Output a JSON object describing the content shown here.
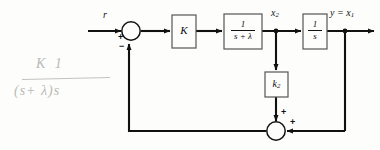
{
  "figure": {
    "type": "control-system-block-diagram",
    "background_color": "#fdfdfc",
    "line_color": "#111111",
    "annotation_color": "#b9b9b5"
  },
  "signals": {
    "input_label": "r",
    "state_x2_label": "x",
    "state_x2_sub": "2",
    "output_label": "y = x",
    "output_sub": "1"
  },
  "blocks": {
    "gain_k": "K",
    "lag_numerator": "1",
    "lag_denominator": "s + λ",
    "integrator_numerator": "1",
    "integrator_denominator": "s",
    "feedback_gain": "k",
    "feedback_gain_sub": "2"
  },
  "summing_junctions": {
    "input_sum": {
      "reference_sign": "+",
      "feedback_sign": "−"
    },
    "feedback_sum": {
      "inner_sign": "+",
      "outer_sign": "+"
    }
  },
  "annotation": {
    "numerator": "K  1",
    "denominator": "(s+ λ)s"
  }
}
